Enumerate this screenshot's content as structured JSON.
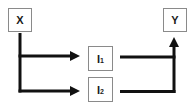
{
  "diagram": {
    "type": "causal-path-diagram",
    "nodes": [
      {
        "id": "X",
        "label": "X",
        "sub": ""
      },
      {
        "id": "I1",
        "label": "I",
        "sub": "1"
      },
      {
        "id": "I2",
        "label": "I",
        "sub": "2"
      },
      {
        "id": "Y",
        "label": "Y",
        "sub": ""
      }
    ],
    "edges": [
      {
        "from": "X",
        "to": "I1",
        "arrow": true
      },
      {
        "from": "X",
        "to": "I2",
        "arrow": true
      },
      {
        "from": "I1",
        "to": "Y",
        "arrow": true
      },
      {
        "from": "I2",
        "to": "Y",
        "arrow": true
      }
    ],
    "colors": {
      "line": "#111111",
      "box_border": "#8a8a8a",
      "text": "#1a1a1a",
      "background": "#ffffff"
    }
  }
}
